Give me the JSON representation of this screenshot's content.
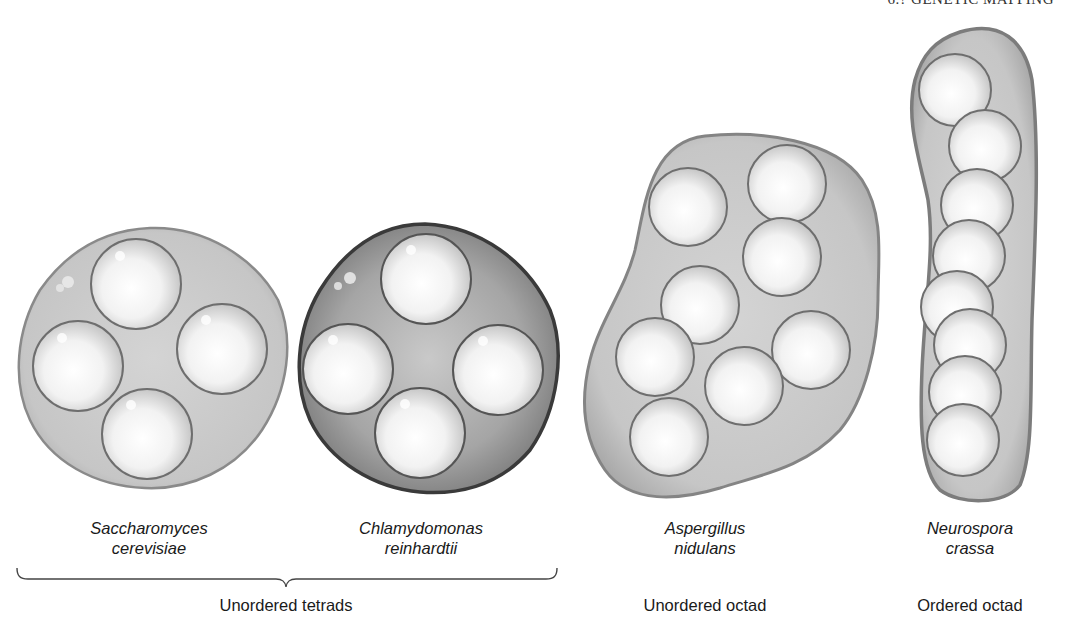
{
  "header": {
    "running_title": "6.? GENETIC MAPPING"
  },
  "organisms": [
    {
      "genus": "Saccharomyces",
      "species": "cerevisiae",
      "spores": 4
    },
    {
      "genus": "Chlamydomonas",
      "species": "reinhardtii",
      "spores": 4
    },
    {
      "genus": "Aspergillus",
      "species": "nidulans",
      "spores": 8
    },
    {
      "genus": "Neurospora",
      "species": "crassa",
      "spores": 8
    }
  ],
  "categories": {
    "tetrads": "Unordered tetrads",
    "unordered_octad": "Unordered octad",
    "ordered_octad": "Ordered octad"
  },
  "colors": {
    "ascus_fill": "#c4c4c4",
    "ascus_stroke": "#7a7a7a",
    "chlamy_fill": "#a8a8a8",
    "chlamy_stroke": "#3e3e3e",
    "spore_fill": "#f4f4f4",
    "spore_stroke": "#6e6e6e"
  }
}
